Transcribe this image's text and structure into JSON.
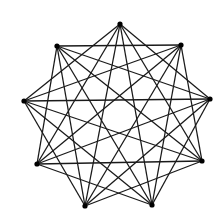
{
  "diagram": {
    "type": "graph",
    "colors": {
      "edge": "#1a1a1a",
      "vertex": "#000000",
      "background": "#ffffff"
    },
    "vertex_radius": 2.6,
    "vertices": [
      {
        "id": 0,
        "x": 120,
        "y": 24
      },
      {
        "id": 1,
        "x": 181,
        "y": 45
      },
      {
        "id": 2,
        "x": 210,
        "y": 99
      },
      {
        "id": 3,
        "x": 202,
        "y": 161
      },
      {
        "id": 4,
        "x": 152,
        "y": 205
      },
      {
        "id": 5,
        "x": 85,
        "y": 206
      },
      {
        "id": 6,
        "x": 37,
        "y": 164
      },
      {
        "id": 7,
        "x": 24,
        "y": 101
      },
      {
        "id": 8,
        "x": 57,
        "y": 46
      }
    ],
    "edges": [
      [
        0,
        2
      ],
      [
        0,
        3
      ],
      [
        0,
        4
      ],
      [
        0,
        5
      ],
      [
        0,
        6
      ],
      [
        0,
        7
      ],
      [
        1,
        3
      ],
      [
        1,
        4
      ],
      [
        1,
        5
      ],
      [
        1,
        6
      ],
      [
        1,
        7
      ],
      [
        1,
        8
      ],
      [
        2,
        4
      ],
      [
        2,
        5
      ],
      [
        2,
        6
      ],
      [
        2,
        7
      ],
      [
        2,
        8
      ],
      [
        3,
        5
      ],
      [
        3,
        6
      ],
      [
        3,
        7
      ],
      [
        3,
        8
      ],
      [
        4,
        6
      ],
      [
        4,
        7
      ],
      [
        4,
        8
      ],
      [
        5,
        7
      ],
      [
        5,
        8
      ],
      [
        6,
        8
      ]
    ]
  }
}
